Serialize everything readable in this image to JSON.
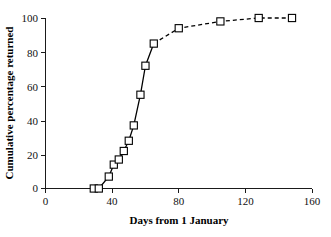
{
  "chart_data": {
    "type": "line",
    "title": "",
    "xlabel": "Days from 1 January",
    "ylabel": "Cumulative percentage returned",
    "xlim": [
      0,
      160
    ],
    "ylim": [
      0,
      100
    ],
    "xticks": [
      0,
      40,
      80,
      120,
      160
    ],
    "yticks": [
      0,
      20,
      40,
      60,
      80,
      100
    ],
    "xtick_labels": [
      "0",
      "40",
      "80",
      "120",
      "160"
    ],
    "ytick_labels": [
      "0",
      "20",
      "40",
      "60",
      "80",
      "100"
    ],
    "grid": false,
    "legend": null,
    "marker": "open-square",
    "marker_color": "#ffffff",
    "line_color": "#000000",
    "series": [
      {
        "name": "Cumulative percentage returned",
        "x": [
          29,
          32,
          38,
          41,
          44,
          47,
          50,
          53,
          57,
          60,
          65,
          80,
          105,
          128,
          148
        ],
        "y": [
          0,
          0,
          7,
          14,
          17,
          22,
          28,
          37,
          55,
          72,
          85,
          94,
          98,
          100,
          100
        ],
        "style": "solid-then-dashed",
        "dashed_from_index": 10
      }
    ],
    "points": [
      {
        "x": 29,
        "y": 0
      },
      {
        "x": 32,
        "y": 0
      },
      {
        "x": 38,
        "y": 7
      },
      {
        "x": 41,
        "y": 14
      },
      {
        "x": 44,
        "y": 17
      },
      {
        "x": 47,
        "y": 22
      },
      {
        "x": 50,
        "y": 28
      },
      {
        "x": 53,
        "y": 37
      },
      {
        "x": 57,
        "y": 55
      },
      {
        "x": 60,
        "y": 72
      },
      {
        "x": 65,
        "y": 85
      },
      {
        "x": 80,
        "y": 94
      },
      {
        "x": 105,
        "y": 98
      },
      {
        "x": 128,
        "y": 100
      }
    ]
  },
  "axes": {
    "x_title": "Days from 1 January",
    "y_title": "Cumulative percentage returned",
    "x_tick_labels": [
      "0",
      "40",
      "80",
      "120",
      "160"
    ],
    "y_tick_labels": [
      "0",
      "20",
      "40",
      "60",
      "80",
      "100"
    ]
  }
}
